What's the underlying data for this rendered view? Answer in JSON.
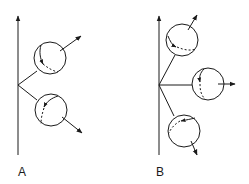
{
  "panels": [
    {
      "label": "A",
      "axis": {
        "x": 18,
        "y_top": 16,
        "y_bottom": 155
      },
      "branch_point": [
        18,
        85
      ],
      "spheres": [
        {
          "name": "upper",
          "cx": 50,
          "cy": 58,
          "r": 16,
          "arrow": [
            [
              60,
              51
            ],
            [
              81,
              36
            ]
          ]
        },
        {
          "name": "lower",
          "cx": 51,
          "cy": 110,
          "r": 16,
          "arrow": [
            [
              62,
              117
            ],
            [
              82,
              133
            ]
          ]
        }
      ]
    },
    {
      "label": "B",
      "axis": {
        "x": 159,
        "y_top": 16,
        "y_bottom": 155
      },
      "branch_point": [
        159,
        85
      ],
      "spheres": [
        {
          "name": "upper",
          "cx": 182,
          "cy": 40,
          "r": 16,
          "arrow": [
            [
              188,
              30
            ],
            [
              197,
              15
            ]
          ]
        },
        {
          "name": "middle",
          "cx": 208,
          "cy": 84,
          "r": 16,
          "arrow": [
            [
              218,
              84
            ],
            [
              235,
              84
            ]
          ]
        },
        {
          "name": "lower",
          "cx": 184,
          "cy": 131,
          "r": 16,
          "arrow": [
            [
              191,
              141
            ],
            [
              197,
              155
            ]
          ]
        }
      ]
    }
  ],
  "colors": {
    "stroke": "#1a1a1a",
    "background": "#ffffff"
  }
}
